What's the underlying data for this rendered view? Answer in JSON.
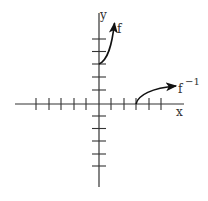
{
  "diagram": {
    "type": "function-and-inverse-graph",
    "axes": {
      "x_label": "x",
      "y_label": "y",
      "x_ticks": [
        -5,
        -4,
        -3,
        -2,
        -1,
        1,
        2,
        3,
        4,
        5
      ],
      "y_ticks": [
        -5,
        -4,
        -3,
        -2,
        -1,
        1,
        2,
        3,
        4,
        5
      ],
      "x_range": [
        -6.7,
        6.8
      ],
      "y_range": [
        -6.6,
        7.3
      ]
    },
    "curves": [
      {
        "name": "f",
        "label": "f",
        "start_point": [
          0,
          3
        ],
        "direction": "up-right, arrow at end",
        "end_point_approx": [
          1.2,
          6.5
        ]
      },
      {
        "name": "f_inverse",
        "label": "f",
        "label_superscript": "−1",
        "start_point": [
          3,
          0
        ],
        "direction": "right-up, arrow at end",
        "end_point_approx": [
          6.2,
          1.4
        ]
      }
    ],
    "colors": {
      "axis": "#333333",
      "curve": "#111111",
      "background": "#ffffff"
    }
  }
}
